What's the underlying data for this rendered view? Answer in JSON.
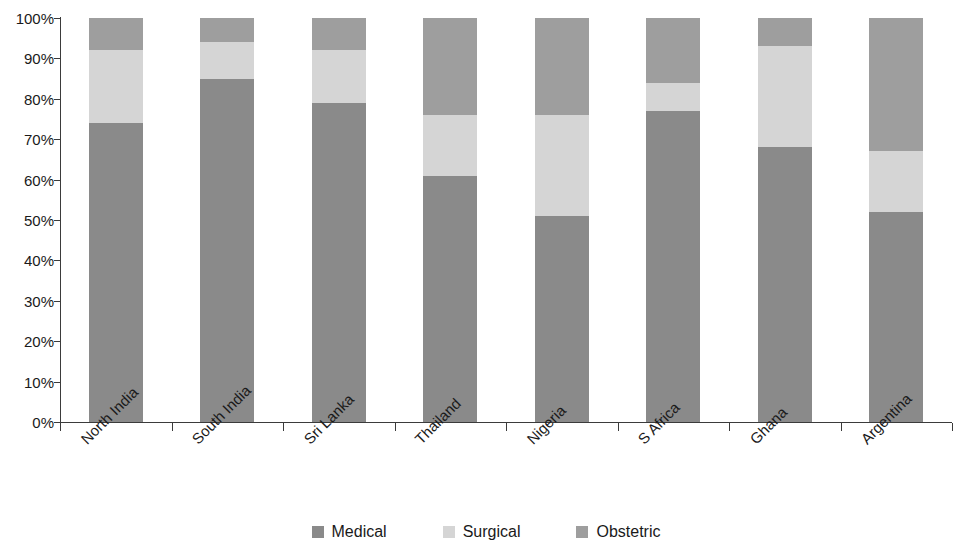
{
  "chart_data": {
    "type": "bar",
    "stacked": true,
    "normalized": true,
    "title": "",
    "subtitle": "",
    "xlabel": "",
    "ylabel": "",
    "ylim": [
      0,
      100
    ],
    "ytick_labels": [
      "100%",
      "90%",
      "80%",
      "70%",
      "60%",
      "50%",
      "40%",
      "30%",
      "20%",
      "10%",
      "0%"
    ],
    "ytick_values": [
      100,
      90,
      80,
      70,
      60,
      50,
      40,
      30,
      20,
      10,
      0
    ],
    "grid": false,
    "legend_position": "bottom",
    "categories": [
      "North India",
      "South India",
      "Sri Lanka",
      "Thailand",
      "Nigeria",
      "S Africa",
      "Ghana",
      "Argentina"
    ],
    "series": [
      {
        "name": "Medical",
        "color": "#8a8a8a",
        "values": [
          74,
          85,
          79,
          61,
          51,
          77,
          68,
          52
        ]
      },
      {
        "name": "Surgical",
        "color": "#d5d5d5",
        "values": [
          18,
          9,
          13,
          15,
          25,
          7,
          25,
          15
        ]
      },
      {
        "name": "Obstetric",
        "color": "#9e9e9e",
        "values": [
          8,
          6,
          8,
          24,
          24,
          16,
          7,
          33
        ]
      }
    ]
  },
  "legend": {
    "items": [
      {
        "label": "Medical",
        "color": "#8a8a8a"
      },
      {
        "label": "Surgical",
        "color": "#d5d5d5"
      },
      {
        "label": "Obstetric",
        "color": "#9e9e9e"
      }
    ]
  }
}
